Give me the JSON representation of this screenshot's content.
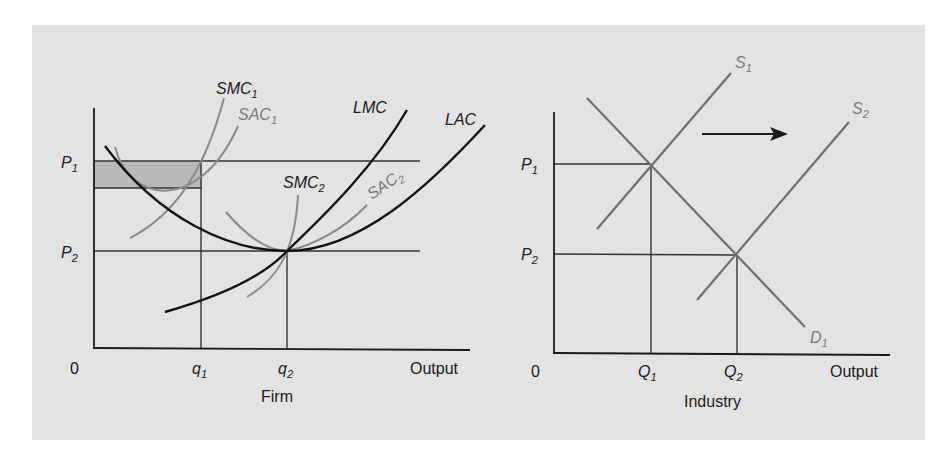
{
  "figure": {
    "firm": {
      "title": "Firm",
      "origin_label": "0",
      "x_axis_label": "Output",
      "price_labels": {
        "p1": "P",
        "p1_sub": "1",
        "p2": "P",
        "p2_sub": "2"
      },
      "quantity_labels": {
        "q1": "q",
        "q1_sub": "1",
        "q2": "q",
        "q2_sub": "2"
      },
      "curves": {
        "smc1": {
          "name": "SMC",
          "sub": "1"
        },
        "sac1": {
          "name": "SAC",
          "sub": "1"
        },
        "lmc": {
          "name": "LMC",
          "sub": ""
        },
        "lac": {
          "name": "LAC",
          "sub": ""
        },
        "smc2": {
          "name": "SMC",
          "sub": "2"
        },
        "sac2": {
          "name": "SAC",
          "sub": "2"
        }
      }
    },
    "industry": {
      "title": "Industry",
      "origin_label": "0",
      "x_axis_label": "Output",
      "price_labels": {
        "p1": "P",
        "p1_sub": "1",
        "p2": "P",
        "p2_sub": "2"
      },
      "quantity_labels": {
        "q1": "Q",
        "q1_sub": "1",
        "q2": "Q",
        "q2_sub": "2"
      },
      "curves": {
        "s1": {
          "name": "S",
          "sub": "1"
        },
        "s2": {
          "name": "S",
          "sub": "2"
        },
        "d1": {
          "name": "D",
          "sub": "1"
        }
      },
      "shift_arrow": "rightward supply shift"
    },
    "colors": {
      "background": "#e3e3e3",
      "axis": "#1a1a1a",
      "long_run_curves": "#111111",
      "short_run_curves": "#8a8a8a",
      "shaded_profit": "#b9b9b9"
    }
  }
}
